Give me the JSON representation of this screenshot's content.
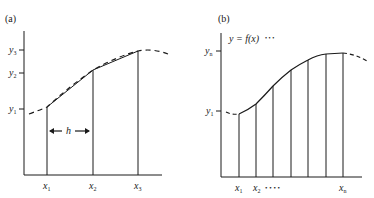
{
  "panel_a": {
    "label": "(a)",
    "y_ticks": [
      {
        "name": "y",
        "sub": "3"
      },
      {
        "name": "y",
        "sub": "2"
      },
      {
        "name": "y",
        "sub": "1"
      }
    ],
    "x_ticks": [
      {
        "name": "x",
        "sub": "1"
      },
      {
        "name": "x",
        "sub": "2"
      },
      {
        "name": "x",
        "sub": "3"
      }
    ],
    "interval_label": "h"
  },
  "panel_b": {
    "label": "(b)",
    "curve_label": "y = f(x)",
    "curve_label_dots": "•   •   •",
    "y_ticks": [
      {
        "name": "y",
        "sub": "n"
      },
      {
        "name": "y",
        "sub": "1"
      }
    ],
    "x_ticks": [
      {
        "name": "x",
        "sub": "1"
      },
      {
        "name": "x",
        "sub": "2"
      },
      {
        "name": "x",
        "sub": "n"
      }
    ],
    "x_ellipsis": "• • • •"
  },
  "colors": {
    "ink": "#1a1a1a",
    "background": "#ffffff"
  }
}
